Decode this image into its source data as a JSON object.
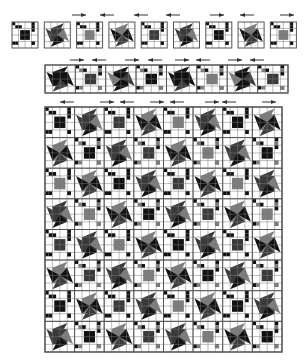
{
  "colors": {
    "background": "#ffffff",
    "grid": "#7a7a7a",
    "border": "#555555",
    "dark": "#111111",
    "mid": "#3a3a3a",
    "gray": "#7d7d7d",
    "light_gray": "#a8a8a8",
    "arrow": "#333333"
  },
  "top_row": {
    "x": 12,
    "y": 22,
    "tile": 26,
    "gap": 6.3,
    "count": 9,
    "tiles": [
      "ninepatch",
      "star",
      "ninepatch",
      "star",
      "ninepatch",
      "star",
      "ninepatch",
      "star",
      "ninepatch"
    ],
    "star_shades": [
      "dark",
      "dark",
      "mid",
      "gray"
    ],
    "arrows": [
      {
        "x": 100,
        "y": 15,
        "dir": "left"
      },
      {
        "x": 72,
        "y": 15,
        "dir": "right"
      },
      {
        "x": 134,
        "y": 15,
        "dir": "left"
      },
      {
        "x": 166,
        "y": 15,
        "dir": "left"
      },
      {
        "x": 210,
        "y": 15,
        "dir": "right"
      },
      {
        "x": 240,
        "y": 15,
        "dir": "left"
      },
      {
        "x": 280,
        "y": 15,
        "dir": "right"
      }
    ]
  },
  "strip": {
    "x": 45,
    "y": 65,
    "w": 243,
    "h": 28,
    "count": 8,
    "tiles": [
      "star",
      "ninepatch",
      "star",
      "ninepatch",
      "star",
      "ninepatch",
      "star",
      "ninepatch"
    ],
    "arrows": [
      {
        "x": 70,
        "y": 60,
        "dir": "right"
      },
      {
        "x": 92,
        "y": 60,
        "dir": "left"
      },
      {
        "x": 125,
        "y": 60,
        "dir": "right"
      },
      {
        "x": 148,
        "y": 60,
        "dir": "left"
      },
      {
        "x": 175,
        "y": 60,
        "dir": "right"
      },
      {
        "x": 196,
        "y": 60,
        "dir": "left"
      },
      {
        "x": 228,
        "y": 60,
        "dir": "right"
      },
      {
        "x": 250,
        "y": 60,
        "dir": "left"
      }
    ]
  },
  "grid": {
    "x": 45,
    "y": 107,
    "w": 237,
    "h": 245,
    "cols": 8,
    "rows": 8,
    "pattern": "checkerboard-ninepatch-star",
    "arrows": [
      {
        "x": 60,
        "y": 102,
        "dir": "left"
      },
      {
        "x": 100,
        "y": 102,
        "dir": "right"
      },
      {
        "x": 120,
        "y": 102,
        "dir": "left"
      },
      {
        "x": 150,
        "y": 102,
        "dir": "right"
      },
      {
        "x": 170,
        "y": 102,
        "dir": "left"
      },
      {
        "x": 205,
        "y": 102,
        "dir": "right"
      },
      {
        "x": 222,
        "y": 102,
        "dir": "left"
      },
      {
        "x": 262,
        "y": 102,
        "dir": "right"
      }
    ]
  }
}
